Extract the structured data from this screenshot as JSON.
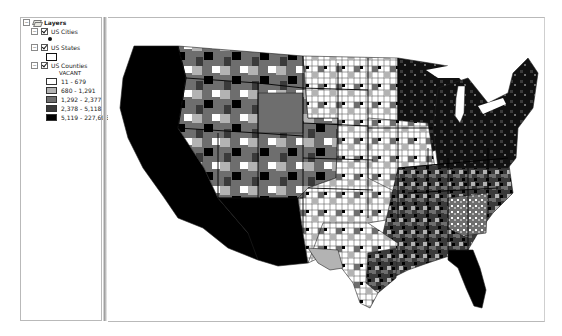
{
  "toc": {
    "root": {
      "label": "Layers",
      "expanded": true,
      "icon": "layers-icon"
    },
    "layers": [
      {
        "label": "US Cities",
        "checked": true,
        "expanded": true,
        "symbol": "point",
        "symbol_color": "#111111"
      },
      {
        "label": "US States",
        "checked": true,
        "expanded": true,
        "symbol": "hollow-polygon",
        "symbol_outline": "#111111"
      },
      {
        "label": "US Counties",
        "checked": true,
        "expanded": true,
        "field": "VACANT",
        "classes": [
          {
            "label": "11 - 679",
            "color": "#ffffff"
          },
          {
            "label": "680 - 1,291",
            "color": "#b3b3b3"
          },
          {
            "label": "1,292 - 2,377",
            "color": "#6e6e6e"
          },
          {
            "label": "2,378 - 5,118",
            "color": "#3a3a3a"
          },
          {
            "label": "5,119 - 227,696",
            "color": "#000000"
          }
        ]
      }
    ]
  },
  "map": {
    "title": "US Counties choropleth by VACANT",
    "background": "#ffffff"
  }
}
